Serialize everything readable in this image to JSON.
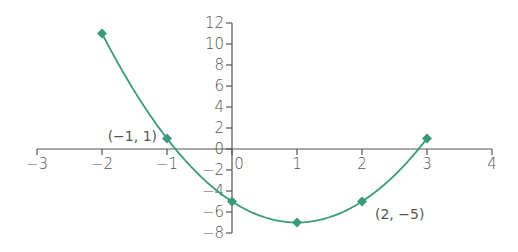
{
  "chart_data": {
    "type": "line",
    "title": "",
    "xlabel": "",
    "ylabel": "",
    "function": "y = 2x^2 - 4x - 5",
    "x": [
      -2,
      -1,
      0,
      1,
      2,
      3
    ],
    "series": [
      {
        "name": "curve",
        "values": [
          11,
          1,
          -5,
          -7,
          -5,
          1
        ],
        "color": "#3a9a7a",
        "marker": "diamond"
      }
    ],
    "xlim": [
      -3,
      4
    ],
    "ylim": [
      -8,
      12
    ],
    "x_ticks": [
      -3,
      -2,
      -1,
      0,
      1,
      2,
      3,
      4
    ],
    "x_tick_labels": [
      "−3",
      "−2",
      "−1",
      "0",
      "1",
      "2",
      "3",
      "4"
    ],
    "y_ticks": [
      12,
      10,
      8,
      6,
      4,
      2,
      0,
      -2,
      -4,
      -6,
      -8
    ],
    "y_tick_labels": [
      "12",
      "10",
      "8",
      "6",
      "4",
      "2",
      "0",
      "−2",
      "−4",
      "−6",
      "−8"
    ],
    "annotations": [
      {
        "text": "(−1, 1)",
        "x": -1,
        "y": 1
      },
      {
        "text": "(2, −5)",
        "x": 2,
        "y": -5
      }
    ],
    "grid": false,
    "legend": "none"
  },
  "colors": {
    "curve": "#3a9a7a",
    "axis": "#555555",
    "text": "#555555"
  }
}
